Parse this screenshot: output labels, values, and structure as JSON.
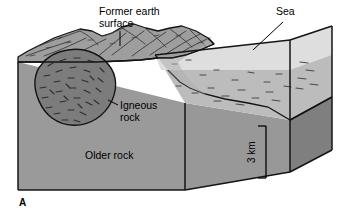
{
  "figure": {
    "panel_label": "A",
    "type": "geologic-block-diagram",
    "labels": {
      "former_surface_line1": "Former earth",
      "former_surface_line2": "surface",
      "sea": "Sea",
      "igneous_line1": "Igneous",
      "igneous_line2": "rock",
      "older_rock": "Older rock",
      "scale": "3 km"
    },
    "colors": {
      "background": "#ffffff",
      "older_rock_front": "#9a9a9a",
      "older_rock_side": "#808080",
      "land_top_surface": "#9e9e9e",
      "land_top_highlight": "#a8a8a8",
      "sediment": "#c0c0c0",
      "sediment_top": "#cfcfcf",
      "sea_water": "#dedede",
      "igneous_body": "#7c7c7c",
      "outline": "#1a1a1a",
      "text": "#000000"
    }
  }
}
